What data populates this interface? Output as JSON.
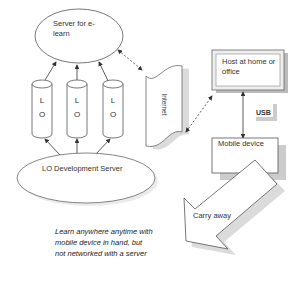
{
  "diagram": {
    "server_elearn": {
      "label": "Server for e-learn"
    },
    "lo_cylinders": [
      {
        "line1": "L",
        "line2": "O"
      },
      {
        "line1": "L",
        "line2": "O"
      },
      {
        "line1": "L",
        "line2": "O"
      }
    ],
    "lo_dev_server": {
      "label": "LO Development Server"
    },
    "internet": {
      "label": "Internet"
    },
    "host": {
      "label": "Host at home or office"
    },
    "usb": {
      "label": "USB"
    },
    "mobile": {
      "label": "Mobile device"
    },
    "carry_away": {
      "label": "Carry away"
    },
    "caption": {
      "text": "Learn anywhere anytime with mobile device in hand, but not networked with a server"
    }
  }
}
